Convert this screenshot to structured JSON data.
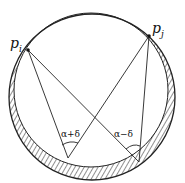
{
  "diagram": {
    "points": [
      {
        "id": "pi",
        "label": "p",
        "sub": "i"
      },
      {
        "id": "pj",
        "label": "p",
        "sub": "j"
      }
    ],
    "angles": [
      {
        "id": "alpha-plus-delta",
        "label": "α+δ"
      },
      {
        "id": "alpha-minus-delta",
        "label": "α−δ"
      }
    ],
    "colors": {
      "line": "#222222",
      "background": "#ffffff"
    }
  }
}
